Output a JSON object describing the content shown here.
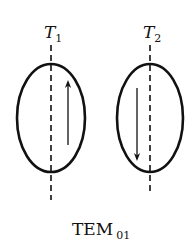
{
  "diagram": {
    "caption": {
      "main": "TEM",
      "subscript": "01"
    },
    "modes": [
      {
        "id": "T1",
        "label": "T",
        "label_subscript": "1",
        "arrow_direction": "up",
        "axis_x": 51,
        "center_y": 118,
        "rx": 34,
        "ry": 54,
        "arrow_x": 68
      },
      {
        "id": "T2",
        "label": "T",
        "label_subscript": "2",
        "arrow_direction": "down",
        "axis_x": 150,
        "center_y": 118,
        "rx": 33,
        "ry": 54,
        "arrow_x": 137
      }
    ],
    "colors": {
      "stroke": "#111111",
      "background": "#ffffff"
    }
  }
}
